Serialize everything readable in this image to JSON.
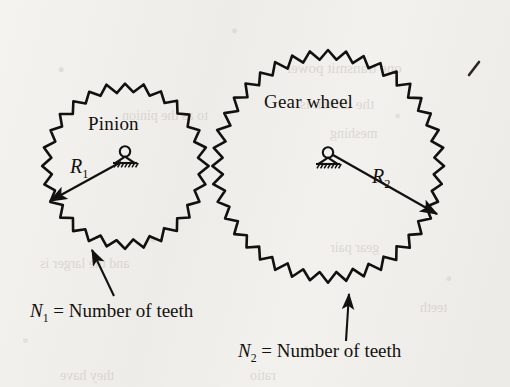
{
  "figure": {
    "kind": "gear-pair-diagram",
    "background_color": "#f2f0ed",
    "ink_color": "#13110f",
    "pinion": {
      "name": "Pinion",
      "label": "Pinion",
      "center_x": 125,
      "center_y": 166,
      "root_radius": 74,
      "tip_radius": 83,
      "teeth": 28,
      "radius_symbol": "R",
      "radius_subscript": "1",
      "radius_label_x": 70,
      "radius_label_y": 155,
      "pivot_x": 125,
      "pivot_y": 163,
      "radius_arrow_to_x": 50,
      "radius_arrow_to_y": 201,
      "teeth_caption_symbol": "N",
      "teeth_caption_subscript": "1",
      "teeth_caption_text": "= Number of teeth",
      "teeth_caption_x": 30,
      "teeth_caption_y": 300,
      "teeth_arrow_from_x": 114,
      "teeth_arrow_from_y": 296,
      "teeth_arrow_to_x": 92,
      "teeth_arrow_to_y": 250
    },
    "gear_wheel": {
      "name": "Gear wheel",
      "label": "Gear wheel",
      "center_x": 328,
      "center_y": 166,
      "root_radius": 106,
      "tip_radius": 116,
      "teeth": 40,
      "radius_symbol": "R",
      "radius_subscript": "2",
      "radius_label_x": 372,
      "radius_label_y": 165,
      "pivot_x": 328,
      "pivot_y": 164,
      "radius_arrow_to_x": 437,
      "radius_arrow_to_y": 214,
      "teeth_caption_symbol": "N",
      "teeth_caption_subscript": "2",
      "teeth_caption_text": "= Number of teeth",
      "teeth_caption_x": 238,
      "teeth_caption_y": 340,
      "teeth_arrow_from_x": 346,
      "teeth_arrow_from_y": 341,
      "teeth_arrow_to_x": 349,
      "teeth_arrow_to_y": 294
    },
    "pinion_label_x": 88,
    "pinion_label_y": 113,
    "gear_label_x": 264,
    "gear_label_y": 91,
    "stray_mark_x": 474,
    "stray_mark_y": 68,
    "ghost_text": [
      {
        "text": "one transmit power",
        "x": 286,
        "y": 60,
        "size": 15
      },
      {
        "text": "the driven is",
        "x": 300,
        "y": 96,
        "size": 15
      },
      {
        "text": "to as the pinion",
        "x": 122,
        "y": 108,
        "size": 14
      },
      {
        "text": "meshing",
        "x": 330,
        "y": 126,
        "size": 14
      },
      {
        "text": "and the larger is",
        "x": 40,
        "y": 256,
        "size": 14
      },
      {
        "text": "gear pair",
        "x": 330,
        "y": 240,
        "size": 14
      },
      {
        "text": "teeth",
        "x": 420,
        "y": 300,
        "size": 14
      },
      {
        "text": "they have",
        "x": 60,
        "y": 368,
        "size": 14
      },
      {
        "text": "ratio",
        "x": 250,
        "y": 368,
        "size": 14
      }
    ]
  }
}
